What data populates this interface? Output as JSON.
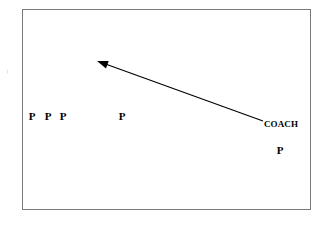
{
  "figure": {
    "kind": "play-diagram",
    "background_color": "#ffffff",
    "ink_color": "#000000",
    "border_color": "#7a7a7a",
    "canvas": {
      "width": 328,
      "height": 225
    },
    "field": {
      "x": 22,
      "y": 9,
      "width": 289,
      "height": 201
    }
  },
  "margin_fragment": {
    "text": "g"
  },
  "players": [
    {
      "label": "P",
      "x": 32,
      "y": 116
    },
    {
      "label": "P",
      "x": 48,
      "y": 116
    },
    {
      "label": "P",
      "x": 63,
      "y": 116
    },
    {
      "label": "P",
      "x": 122,
      "y": 116
    },
    {
      "label": "P",
      "x": 280,
      "y": 150
    }
  ],
  "labels": [
    {
      "text": "COACH",
      "x": 264,
      "y": 124
    }
  ],
  "arrows": [
    {
      "name": "coach-throw-arrow",
      "from_x": 263,
      "from_y": 121,
      "to_x": 97,
      "to_y": 61,
      "stroke_color": "#000000",
      "stroke_width": 1.2,
      "head": "filled-triangle",
      "head_length": 11,
      "head_width": 8
    }
  ]
}
